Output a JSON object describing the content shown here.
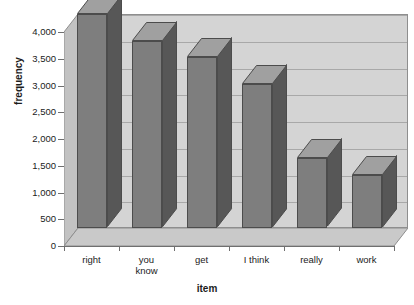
{
  "chart_data": {
    "type": "bar",
    "title": "",
    "subtitle": "",
    "xlabel": "item",
    "ylabel": "frequency",
    "categories": [
      "right",
      "you know",
      "get",
      "I think",
      "really",
      "work"
    ],
    "values": [
      4000,
      3500,
      3200,
      2700,
      1300,
      1000
    ],
    "ylim": [
      0,
      4000
    ],
    "yticks": [
      0,
      500,
      1000,
      1500,
      2000,
      2500,
      3000,
      3500,
      4000
    ],
    "ytick_labels": [
      "0",
      "500",
      "1,000",
      "1,500",
      "2,000",
      "2,500",
      "3,000",
      "3,500",
      "4,000"
    ],
    "grid": true,
    "legend": null,
    "style": "3d-bar",
    "colors": {
      "bar_front": "#7e7e7e",
      "bar_side": "#575757",
      "bar_top": "#a0a0a0",
      "bar_outline": "#4c4c4c",
      "plot_background": "#d4d4d4",
      "gridline": "#a8a8a8",
      "axis": "#6f6f6f",
      "text": "#1b1b1b",
      "page_background": "#ffffff"
    }
  },
  "axes": {
    "y_title": "frequency",
    "x_title": "item",
    "y_tick_labels": [
      "4,000",
      "3,500",
      "3,000",
      "2,500",
      "2,000",
      "1,500",
      "1,000",
      "500",
      "0"
    ],
    "x_tick_labels": [
      {
        "line1": "right",
        "line2": ""
      },
      {
        "line1": "you",
        "line2": "know"
      },
      {
        "line1": "get",
        "line2": ""
      },
      {
        "line1": "I think",
        "line2": ""
      },
      {
        "line1": "really",
        "line2": ""
      },
      {
        "line1": "work",
        "line2": ""
      }
    ]
  }
}
